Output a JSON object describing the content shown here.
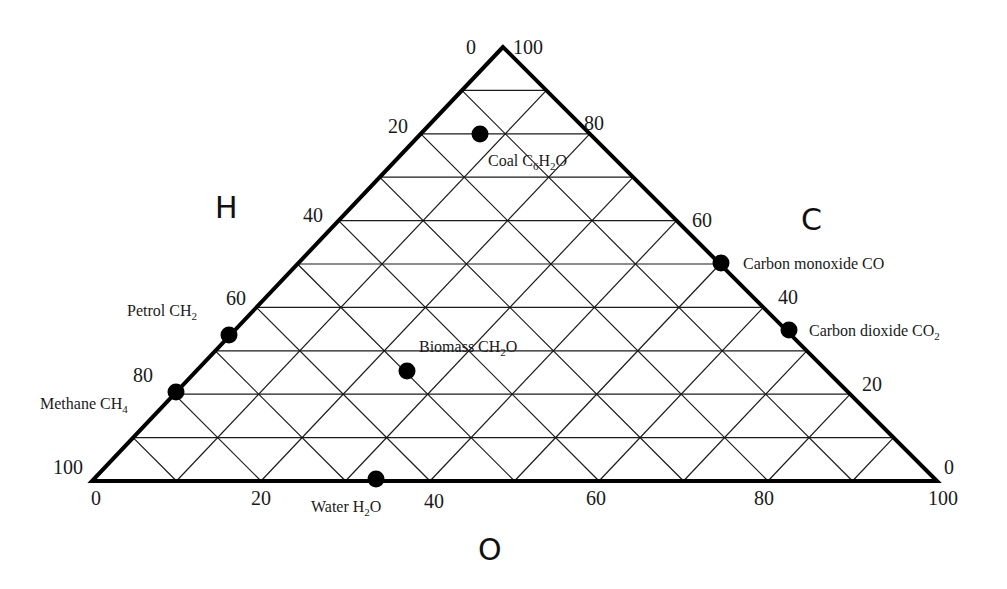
{
  "chart_data": {
    "type": "ternary",
    "title": "",
    "axes": {
      "H": {
        "label": "H",
        "edge": "left",
        "ticks": [
          "0",
          "20",
          "40",
          "60",
          "80",
          "100"
        ]
      },
      "C": {
        "label": "C",
        "edge": "right",
        "ticks": [
          "100",
          "80",
          "60",
          "40",
          "20",
          "0"
        ]
      },
      "O": {
        "label": "O",
        "edge": "bottom",
        "ticks": [
          "0",
          "20",
          "40",
          "60",
          "80",
          "100"
        ]
      }
    },
    "grid": {
      "divisions": 10,
      "on": true
    },
    "points": [
      {
        "name": "Coal",
        "formula": "C6H2O",
        "label_main": "Coal C",
        "sub1": "6",
        "mid": "H",
        "sub2": "2",
        "tail": "O",
        "C": 78,
        "H": 20,
        "O": 2
      },
      {
        "name": "Carbon monoxide",
        "formula": "CO",
        "label_main": "Carbon monoxide CO",
        "C": 50,
        "H": 0,
        "O": 50
      },
      {
        "name": "Carbon dioxide",
        "formula": "CO2",
        "label_main": "Carbon dioxide CO",
        "sub1": "2",
        "C": 33,
        "H": 0,
        "O": 67
      },
      {
        "name": "Petrol",
        "formula": "CH2",
        "label_main": "Petrol CH",
        "sub1": "2",
        "C": 33,
        "H": 67,
        "O": 0
      },
      {
        "name": "Methane",
        "formula": "CH4",
        "label_main": "Methane CH",
        "sub1": "4",
        "C": 20,
        "H": 80,
        "O": 0
      },
      {
        "name": "Biomass",
        "formula": "CH2O",
        "label_main": "Biomass CH",
        "sub1": "2",
        "tail": "O",
        "C": 25,
        "H": 50,
        "O": 25
      },
      {
        "name": "Water",
        "formula": "H2O",
        "label_main": "Water H",
        "sub1": "2",
        "tail": "O",
        "C": 0,
        "H": 67,
        "O": 33
      }
    ]
  },
  "labels": {
    "top_left_zero": "0",
    "top_right_hundred": "100",
    "h_ticks": {
      "t20": "20",
      "t40": "40",
      "t60": "60",
      "t80": "80",
      "t100": "100"
    },
    "c_ticks": {
      "t80": "80",
      "t60": "60",
      "t40": "40",
      "t20": "20",
      "t0": "0"
    },
    "o_ticks": {
      "t0": "0",
      "t20": "20",
      "t40": "40",
      "t60": "60",
      "t80": "80",
      "t100": "100"
    },
    "axis_H": "H",
    "axis_C": "C",
    "axis_O": "O",
    "points": {
      "coal": {
        "a": "Coal C",
        "s1": "6",
        "b": "H",
        "s2": "2",
        "c": "O"
      },
      "co": {
        "a": "Carbon monoxide CO"
      },
      "co2": {
        "a": "Carbon dioxide CO",
        "s1": "2"
      },
      "petrol": {
        "a": "Petrol CH",
        "s1": "2"
      },
      "methane": {
        "a": "Methane CH",
        "s1": "4"
      },
      "biomass": {
        "a": "Biomass CH",
        "s1": "2",
        "c": "O"
      },
      "water": {
        "a": "Water H",
        "s1": "2",
        "c": "O"
      }
    }
  }
}
